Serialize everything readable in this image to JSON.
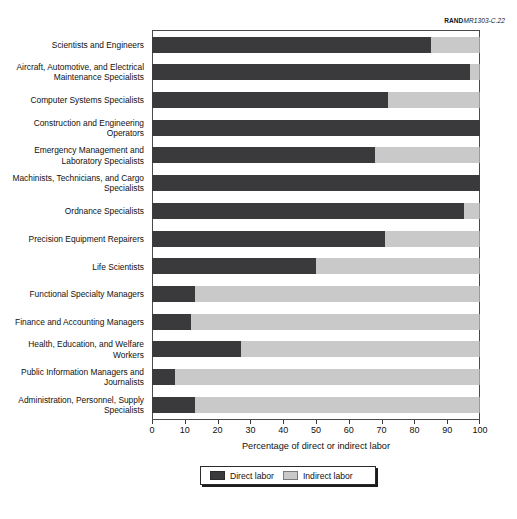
{
  "source_id": {
    "brand": "RAND",
    "rest": "MR1303-C.22"
  },
  "axis": {
    "x_title": "Percentage of direct or indirect labor",
    "ticks": [
      "0",
      "10",
      "20",
      "30",
      "40",
      "50",
      "60",
      "70",
      "80",
      "90",
      "100"
    ]
  },
  "legend": {
    "direct_label": "Direct labor",
    "indirect_label": "Indirect labor"
  },
  "colors": {
    "direct": "#3a3a3c",
    "indirect": "#c9c9c9",
    "frame": "#4a4a4a"
  },
  "categories": [
    "Scientists and Engineers",
    "Aircraft, Automotive, and Electrical Maintenance Specialists",
    "Computer Systems Specialists",
    "Construction and Engineering Operators",
    "Emergency Management and Laboratory Specialists",
    "Machinists, Technicians, and Cargo Specialists",
    "Ordnance Specialists",
    "Precision Equipment Repairers",
    "Life Scientists",
    "Functional Specialty Managers",
    "Finance and Accounting Managers",
    "Health, Education, and Welfare Workers",
    "Public Information Managers and Journalists",
    "Administration, Personnel, Supply Specialists"
  ],
  "chart_data": {
    "type": "bar",
    "orientation": "horizontal",
    "stacked": true,
    "title": "",
    "xlabel": "Percentage of direct or indirect labor",
    "ylabel": "",
    "xlim": [
      0,
      100
    ],
    "grid": false,
    "legend_position": "bottom-center",
    "categories": [
      "Scientists and Engineers",
      "Aircraft, Automotive, and Electrical Maintenance Specialists",
      "Computer Systems Specialists",
      "Construction and Engineering Operators",
      "Emergency Management and Laboratory Specialists",
      "Machinists, Technicians, and Cargo Specialists",
      "Ordnance Specialists",
      "Precision Equipment Repairers",
      "Life Scientists",
      "Functional Specialty Managers",
      "Finance and Accounting Managers",
      "Health, Education, and Welfare Workers",
      "Public Information Managers and Journalists",
      "Administration, Personnel, Supply Specialists"
    ],
    "series": [
      {
        "name": "Direct labor",
        "color": "#3a3a3c",
        "values": [
          85,
          97,
          72,
          100,
          68,
          100,
          95,
          71,
          50,
          13,
          12,
          27,
          7,
          13
        ]
      },
      {
        "name": "Indirect labor",
        "color": "#c9c9c9",
        "values": [
          15,
          3,
          28,
          0,
          32,
          0,
          5,
          29,
          50,
          87,
          88,
          73,
          93,
          87
        ]
      }
    ]
  }
}
